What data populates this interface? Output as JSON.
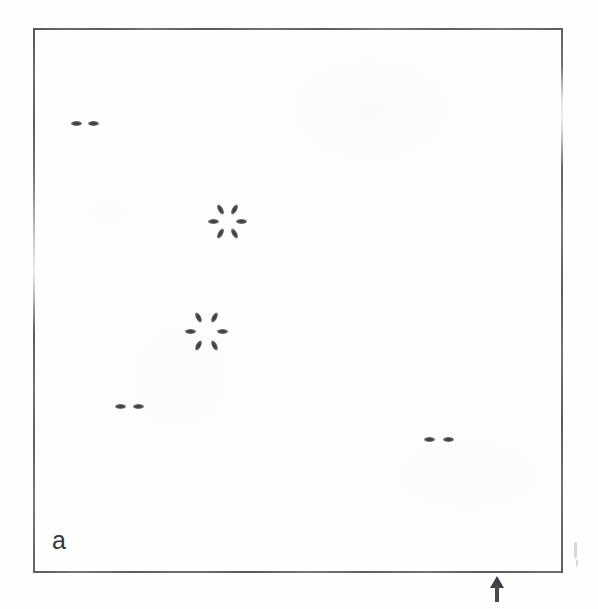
{
  "figure": {
    "panel_label": "a",
    "caption_text": "",
    "background_color": "#fefefe",
    "ink_color": "#4a4a4e",
    "frame_color": "#6f6f72"
  },
  "frame": {
    "left": 33,
    "top": 28,
    "width": 530,
    "height": 545,
    "stroke_width": 2
  },
  "chart_data": {
    "type": "scatter",
    "title": "a",
    "subtitle": "",
    "xlabel": "",
    "ylabel": "",
    "xlim": [
      33,
      563
    ],
    "ylim": [
      28,
      573
    ],
    "grid": false,
    "legend": null,
    "axis_ticks": false,
    "marker_unit": "pixel",
    "groups": [
      {
        "id": "pair-upper-left",
        "kind": "pair",
        "center_x": 85,
        "center_y": 123,
        "separation": 17,
        "spot_count": 2,
        "spots": [
          {
            "x": 76,
            "y": 123,
            "angle": 0
          },
          {
            "x": 93,
            "y": 123,
            "angle": 0
          }
        ]
      },
      {
        "id": "rosette-upper",
        "kind": "rosette",
        "center_x": 227,
        "center_y": 221,
        "radius": 14,
        "fold": 6,
        "spot_count": 6,
        "spots": [
          {
            "x": 213,
            "y": 221,
            "angle": 0
          },
          {
            "x": 220,
            "y": 209,
            "angle": 60
          },
          {
            "x": 234,
            "y": 209,
            "angle": 120
          },
          {
            "x": 241,
            "y": 221,
            "angle": 0
          },
          {
            "x": 234,
            "y": 233,
            "angle": 60
          },
          {
            "x": 220,
            "y": 233,
            "angle": 120
          }
        ]
      },
      {
        "id": "rosette-lower",
        "kind": "rosette",
        "center_x": 206,
        "center_y": 331,
        "radius": 16,
        "fold": 6,
        "spot_count": 6,
        "spots": [
          {
            "x": 190,
            "y": 331,
            "angle": 0
          },
          {
            "x": 198,
            "y": 317,
            "angle": 62
          },
          {
            "x": 214,
            "y": 317,
            "angle": 118
          },
          {
            "x": 222,
            "y": 331,
            "angle": 0
          },
          {
            "x": 214,
            "y": 345,
            "angle": 62
          },
          {
            "x": 198,
            "y": 345,
            "angle": 118
          }
        ]
      },
      {
        "id": "pair-lower-left",
        "kind": "pair",
        "center_x": 129,
        "center_y": 406,
        "separation": 18,
        "spot_count": 2,
        "spots": [
          {
            "x": 120,
            "y": 406,
            "angle": 0
          },
          {
            "x": 138,
            "y": 406,
            "angle": 0
          }
        ]
      },
      {
        "id": "pair-lower-right",
        "kind": "pair",
        "center_x": 438,
        "center_y": 439,
        "separation": 19,
        "spot_count": 2,
        "spots": [
          {
            "x": 429,
            "y": 439,
            "angle": 0
          },
          {
            "x": 448,
            "y": 439,
            "angle": 0
          }
        ]
      }
    ],
    "annotations": [
      {
        "id": "bottom-arrow",
        "symbol": "up-arrow",
        "x": 497,
        "y": 580,
        "points": "up",
        "label": ""
      }
    ]
  },
  "artifacts": {
    "stray_flecks": [
      {
        "x": 574,
        "y": 542,
        "w": 3,
        "h": 16
      },
      {
        "x": 576,
        "y": 560,
        "w": 2,
        "h": 6
      }
    ]
  }
}
